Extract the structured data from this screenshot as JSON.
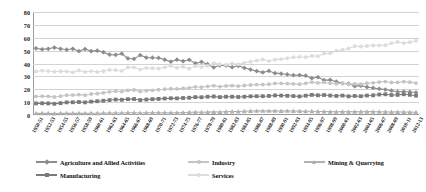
{
  "chart_data": {
    "type": "line",
    "title": "",
    "subtitle": "",
    "xlabel": "",
    "ylabel": "",
    "ylim": [
      0,
      80
    ],
    "ytick_step": 10,
    "yticks": [
      0,
      10,
      20,
      30,
      40,
      50,
      60,
      70,
      80
    ],
    "grid": true,
    "legend_position": "bottom",
    "markers": true,
    "x": [
      "1950-51",
      "1951-52",
      "1952-53",
      "1953-54",
      "1954-55",
      "1955-56",
      "1956-57",
      "1957-58",
      "1958-59",
      "1959-60",
      "1960-61",
      "1961-62",
      "1962-63",
      "1963-64",
      "1964-65",
      "1965-66",
      "1966-67",
      "1967-68",
      "1968-69",
      "1969-70",
      "1970-71",
      "1971-72",
      "1972-73",
      "1973-74",
      "1974-75",
      "1975-76",
      "1976-77",
      "1977-78",
      "1978-79",
      "1979-80",
      "1980-81",
      "1981-82",
      "1982-83",
      "1983-84",
      "1984-85",
      "1985-86",
      "1986-87",
      "1987-88",
      "1988-89",
      "1989-90",
      "1990-91",
      "1991-92",
      "1992-93",
      "1993-94",
      "1994-95",
      "1995-96",
      "1996-97",
      "1997-98",
      "1998-99",
      "1999-00",
      "2000-01",
      "2001-02",
      "2002-03",
      "2003-04",
      "2004-05",
      "2005-06",
      "2006-07",
      "2007-08",
      "2008-09",
      "2009-10",
      "2010-11",
      "2011-12",
      "2012-13"
    ],
    "xtick_labels": [
      "1950-51",
      "1952-53",
      "1954-55",
      "1956-57",
      "1958-59",
      "1960-61",
      "1962-63",
      "1964-65",
      "1966-67",
      "1968-69",
      "1970-71",
      "1972-73",
      "1974-75",
      "1976-77",
      "1978-79",
      "1980-81",
      "1982-83",
      "1984-85",
      "1986-87",
      "1988-89",
      "1990-91",
      "1992-93",
      "1994-95",
      "1996-97",
      "1998-99",
      "2000-01",
      "2002-03",
      "2004-05",
      "2006-07",
      "2008-09",
      "2010-11",
      "2012-13"
    ],
    "series": [
      {
        "name": "Agriculture and Allied Activities",
        "color": "#8c8c8c",
        "marker": "diamond",
        "values": [
          51.8,
          51.0,
          51.4,
          52.4,
          51.4,
          50.7,
          51.4,
          49.6,
          51.2,
          49.6,
          50.0,
          48.8,
          46.9,
          46.7,
          47.6,
          43.9,
          43.6,
          46.5,
          44.6,
          44.5,
          44.3,
          43.0,
          41.4,
          43.0,
          41.8,
          42.9,
          40.1,
          41.2,
          39.5,
          36.9,
          38.6,
          38.4,
          37.1,
          38.2,
          36.6,
          35.3,
          34.1,
          33.1,
          34.2,
          32.5,
          32.1,
          31.5,
          30.9,
          31.0,
          30.5,
          28.6,
          29.4,
          27.0,
          27.3,
          25.9,
          24.6,
          24.4,
          22.4,
          22.8,
          21.7,
          21.0,
          20.3,
          19.8,
          18.9,
          18.0,
          18.2,
          17.9,
          17.5
        ],
        "start_value": 51.8,
        "end_value": 17.5
      },
      {
        "name": "Industry",
        "color": "#c4c4c4",
        "marker": "circle",
        "values": [
          14.4,
          14.6,
          14.5,
          14.0,
          14.6,
          15.4,
          15.5,
          15.8,
          15.4,
          16.3,
          16.6,
          17.2,
          18.0,
          18.5,
          18.2,
          19.1,
          19.4,
          18.2,
          18.8,
          19.2,
          19.6,
          20.0,
          20.4,
          20.3,
          20.7,
          21.1,
          21.9,
          21.6,
          22.3,
          22.8,
          22.0,
          22.6,
          22.8,
          22.5,
          22.9,
          23.3,
          23.6,
          23.7,
          23.9,
          24.5,
          24.5,
          24.4,
          24.2,
          23.9,
          24.6,
          25.5,
          24.9,
          25.3,
          24.7,
          24.2,
          24.7,
          23.9,
          24.2,
          24.0,
          24.7,
          25.0,
          25.6,
          26.0,
          25.3,
          25.3,
          25.9,
          25.5,
          24.8
        ],
        "start_value": 14.4,
        "end_value": 24.8
      },
      {
        "name": "Mining & Quarrying",
        "color": "#b0b0b0",
        "marker": "triangle",
        "values": [
          1.3,
          1.3,
          1.3,
          1.2,
          1.3,
          1.3,
          1.3,
          1.4,
          1.3,
          1.4,
          1.4,
          1.5,
          1.6,
          1.6,
          1.6,
          1.7,
          1.7,
          1.6,
          1.7,
          1.7,
          1.7,
          1.7,
          1.8,
          1.8,
          2.0,
          2.1,
          2.2,
          2.1,
          2.2,
          2.4,
          2.3,
          2.6,
          2.7,
          2.7,
          2.9,
          3.1,
          3.2,
          3.2,
          3.2,
          3.2,
          3.1,
          3.2,
          3.1,
          3.0,
          2.9,
          2.9,
          2.7,
          2.7,
          2.6,
          2.5,
          2.6,
          2.5,
          2.6,
          2.5,
          2.6,
          2.6,
          2.5,
          2.4,
          2.3,
          2.4,
          2.3,
          2.2,
          2.1
        ],
        "start_value": 1.3,
        "end_value": 2.1
      },
      {
        "name": "Manufacturing",
        "color": "#7a7a7a",
        "marker": "square",
        "values": [
          9.0,
          9.1,
          9.0,
          8.7,
          9.2,
          9.8,
          9.9,
          10.1,
          9.8,
          10.4,
          10.7,
          11.1,
          11.6,
          12.0,
          11.8,
          12.3,
          12.4,
          11.6,
          12.0,
          12.3,
          12.5,
          12.8,
          13.0,
          12.9,
          13.2,
          13.4,
          13.9,
          13.8,
          14.2,
          14.4,
          13.9,
          14.2,
          14.2,
          14.0,
          14.2,
          14.5,
          14.6,
          14.6,
          14.8,
          15.2,
          15.1,
          14.9,
          14.7,
          14.4,
          15.0,
          15.6,
          15.3,
          15.5,
          15.1,
          14.8,
          15.1,
          14.5,
          14.8,
          14.6,
          15.1,
          15.3,
          15.9,
          16.1,
          15.5,
          15.6,
          16.1,
          15.7,
          15.0
        ],
        "start_value": 9.0,
        "end_value": 15.0
      },
      {
        "name": "Services",
        "color": "#dcdcdc",
        "marker": "circle",
        "values": [
          33.8,
          34.4,
          34.1,
          33.6,
          34.0,
          33.9,
          33.1,
          34.6,
          33.4,
          34.1,
          33.4,
          34.0,
          35.1,
          34.8,
          34.2,
          37.0,
          37.0,
          35.3,
          36.6,
          36.3,
          36.1,
          37.0,
          38.2,
          36.7,
          37.5,
          36.0,
          38.0,
          37.2,
          38.2,
          40.3,
          39.4,
          39.0,
          40.1,
          39.3,
          40.5,
          41.4,
          42.3,
          43.2,
          41.9,
          43.0,
          43.4,
          44.1,
          44.9,
          45.1,
          44.9,
          45.9,
          45.7,
          47.7,
          48.0,
          49.9,
          50.7,
          51.7,
          53.4,
          53.2,
          53.6,
          54.0,
          54.1,
          54.2,
          55.8,
          56.7,
          55.9,
          56.6,
          57.7
        ],
        "start_value": 33.8,
        "end_value": 57.7
      }
    ]
  },
  "legend": {
    "rows": [
      [
        {
          "label": "Agriculture and Allied Activities",
          "color": "#8c8c8c",
          "marker": "diamond",
          "name": "legend-agriculture"
        },
        {
          "label": "Industry",
          "color": "#c4c4c4",
          "marker": "circle",
          "name": "legend-industry"
        },
        {
          "label": "Mining & Quarrying",
          "color": "#b0b0b0",
          "marker": "triangle",
          "name": "legend-mining"
        }
      ],
      [
        {
          "label": "Manufacturing",
          "color": "#7a7a7a",
          "marker": "square",
          "name": "legend-manufacturing"
        },
        {
          "label": "Services",
          "color": "#dcdcdc",
          "marker": "circle",
          "name": "legend-services"
        }
      ]
    ]
  },
  "axes": {
    "y_min_label": "0",
    "y_max_label": "80",
    "gridline_color": "#d3d3d3",
    "axis_color": "#9a9a9a"
  }
}
